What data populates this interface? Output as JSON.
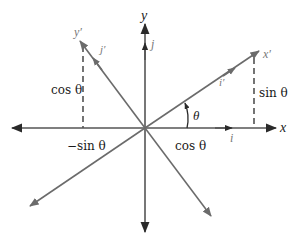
{
  "diagram": {
    "colors": {
      "axis": "#2a2a2a",
      "rotated_axis": "#6b6b6b",
      "label": "#1a1a1a",
      "unit_vector_label": "#777777"
    },
    "axes": {
      "x_label": "x",
      "y_label": "y",
      "x_prime_label": "x′",
      "y_prime_label": "y′"
    },
    "unit_vectors": {
      "i": "i",
      "j": "j",
      "i_prime": "i′",
      "j_prime": "j′"
    },
    "angle_label": "θ",
    "projections": {
      "cos_left": "cos θ",
      "sin_right": "sin θ",
      "neg_sin_bottom": "−sin θ",
      "cos_bottom": "cos θ"
    }
  }
}
